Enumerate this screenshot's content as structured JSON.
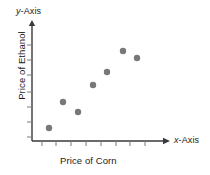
{
  "labels": {
    "y_axis_name_italic": "y",
    "y_axis_name_rest": "-Axis",
    "x_axis_name_italic": "x",
    "x_axis_name_rest": "-Axis",
    "y_title": "Price of Ethanol",
    "x_title": "Price of Corn"
  },
  "colors": {
    "axis": "#3a3a3a",
    "tick": "#7a7a7a",
    "point": "#787878",
    "text": "#1a1a1a",
    "background": "#ffffff"
  },
  "chart_data": {
    "type": "scatter",
    "title": "",
    "xlabel": "Price of Corn",
    "ylabel": "Price of Ethanol",
    "x_axis_name": "x-Axis",
    "y_axis_name": "y-Axis",
    "grid": false,
    "legend": null,
    "xlim": [
      0,
      8
    ],
    "ylim": [
      0,
      7
    ],
    "x_tick_count": 8,
    "y_tick_count": 7,
    "x_tick_labels": [],
    "y_tick_labels": [],
    "points": [
      {
        "x": 1,
        "y": 1
      },
      {
        "x": 2,
        "y": 2.7
      },
      {
        "x": 3,
        "y": 2.05
      },
      {
        "x": 4,
        "y": 3.9
      },
      {
        "x": 5,
        "y": 4.75
      },
      {
        "x": 6,
        "y": 6.1
      },
      {
        "x": 7,
        "y": 5.6
      }
    ],
    "point_pixels": [
      {
        "x": 49,
        "y": 128
      },
      {
        "x": 63,
        "y": 102
      },
      {
        "x": 78,
        "y": 112
      },
      {
        "x": 93,
        "y": 85
      },
      {
        "x": 107,
        "y": 72
      },
      {
        "x": 123,
        "y": 51
      },
      {
        "x": 137,
        "y": 58
      }
    ],
    "point_radius": 3.2,
    "x_tick_pixels": [
      42,
      56,
      71,
      86,
      101,
      116,
      130,
      145
    ],
    "y_tick_pixels": [
      45,
      60,
      75,
      92,
      107,
      122,
      137
    ],
    "axis_origin_pixel": {
      "x": 32,
      "y": 141
    },
    "y_axis_top_pixel": 20,
    "x_axis_right_pixel": 170
  }
}
